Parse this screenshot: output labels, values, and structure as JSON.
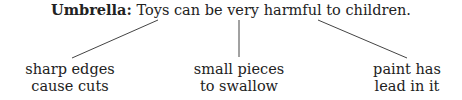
{
  "diagram": {
    "umbrella_label": "Umbrella:",
    "umbrella_text": " Toys can be very harmful to children.",
    "branches": [
      {
        "line1": "sharp edges",
        "line2": "cause cuts"
      },
      {
        "line1": "small pieces",
        "line2": "to swallow"
      },
      {
        "line1": "paint has",
        "line2": "lead in it"
      }
    ]
  }
}
